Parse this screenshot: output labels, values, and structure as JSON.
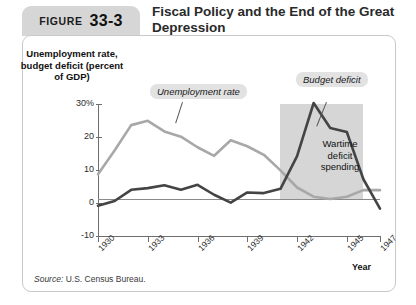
{
  "figure": {
    "word": "FIGURE",
    "number": "33-3"
  },
  "title": "Fiscal Policy and the End of the Great Depression",
  "source": {
    "prefix": "Source:",
    "text": " U.S. Census Bureau."
  },
  "chart_data": {
    "type": "line",
    "title": "Fiscal Policy and the End of the Great Depression",
    "xlabel": "Year",
    "ylabel": "Unemployment rate, budget deficit (percent of GDP)",
    "ylim": [
      -10,
      30
    ],
    "xlim": [
      1930,
      1947
    ],
    "grid": false,
    "legend": "inline-annotations",
    "yticks": [
      "30%",
      "20",
      "10",
      "0",
      "-10"
    ],
    "ytick_values": [
      30,
      20,
      10,
      0,
      -10
    ],
    "xticks": [
      "1930",
      "1933",
      "1936",
      "1939",
      "1942",
      "1945",
      "1947"
    ],
    "xtick_values": [
      1930,
      1933,
      1936,
      1939,
      1942,
      1945,
      1947
    ],
    "x": [
      1930,
      1931,
      1932,
      1933,
      1934,
      1935,
      1936,
      1937,
      1938,
      1939,
      1940,
      1941,
      1942,
      1943,
      1944,
      1945,
      1946,
      1947
    ],
    "series": [
      {
        "name": "Unemployment rate",
        "color": "#a8a8a8",
        "values": [
          8.7,
          15.9,
          23.6,
          24.9,
          21.7,
          20.1,
          16.9,
          14.3,
          19.0,
          17.2,
          14.6,
          9.9,
          4.7,
          1.9,
          1.2,
          1.9,
          3.9,
          3.9
        ]
      },
      {
        "name": "Budget deficit",
        "color": "#444444",
        "values": [
          -0.8,
          0.6,
          4.0,
          4.5,
          5.4,
          4.0,
          5.5,
          2.5,
          0.1,
          3.2,
          3.0,
          4.3,
          14.2,
          30.3,
          22.7,
          21.5,
          7.2,
          -1.7
        ]
      }
    ],
    "annotations": [
      {
        "name": "unemployment-rate-callout",
        "text": "Unemployment rate"
      },
      {
        "name": "budget-deficit-callout",
        "text": "Budget deficit"
      },
      {
        "name": "wartime-region-label",
        "text": "Wartime deficit spending",
        "lines": [
          "Wartime",
          "deficit",
          "spending"
        ]
      }
    ],
    "shaded_region": {
      "name": "wartime-band",
      "from": 1941,
      "to": 1946,
      "color": "#cfcfcf"
    }
  }
}
